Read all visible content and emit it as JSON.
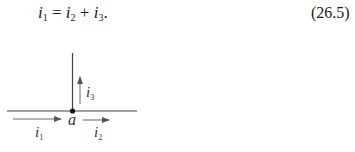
{
  "equation": {
    "lhs": "i",
    "lhs_sub": "1",
    "eq_sign": "=",
    "t1": "i",
    "t1_sub": "2",
    "plus": "+",
    "t2": "i",
    "t2_sub": "3",
    "end": ".",
    "number": "(26.5)"
  },
  "diagram": {
    "node_label": "a",
    "currents": [
      {
        "name": "i",
        "sub": "1",
        "direction": "right",
        "position": "left-branch"
      },
      {
        "name": "i",
        "sub": "2",
        "direction": "right",
        "position": "right-branch"
      },
      {
        "name": "i",
        "sub": "3",
        "direction": "up",
        "position": "vertical-branch"
      }
    ]
  }
}
